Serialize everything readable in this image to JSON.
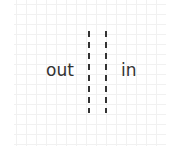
{
  "diagram": {
    "labels": {
      "outside": "out",
      "inside": "in"
    },
    "boundary": {
      "style": "double dashed vertical lines",
      "color": "#333333"
    },
    "grid": {
      "color": "#f1f1f1",
      "spacing_px": 10
    }
  }
}
